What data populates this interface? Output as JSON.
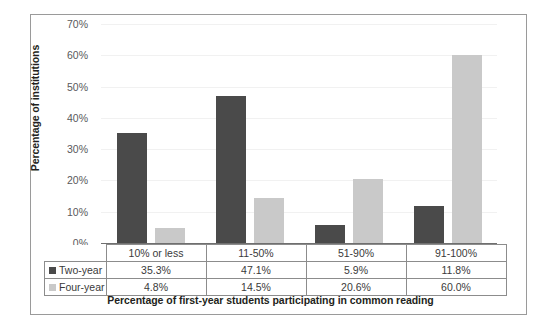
{
  "chart_data": {
    "type": "bar",
    "title": "",
    "xlabel": "Percentage of first-year students participating in common reading",
    "ylabel": "Percentage of institutions",
    "categories": [
      "10% or less",
      "11-50%",
      "51-90%",
      "91-100%"
    ],
    "series": [
      {
        "name": "Two-year",
        "color": "#4a4a4a",
        "values": [
          35.3,
          47.1,
          5.9,
          11.8
        ],
        "labels": [
          "35.3%",
          "47.1%",
          "5.9%",
          "11.8%"
        ]
      },
      {
        "name": "Four-year",
        "color": "#c9c9c9",
        "values": [
          4.8,
          14.5,
          20.6,
          60.0
        ],
        "labels": [
          "4.8%",
          "14.5%",
          "20.6%",
          "60.0%"
        ]
      }
    ],
    "ylim": [
      0,
      70
    ],
    "ytick_labels": [
      "70%",
      "60%",
      "50%",
      "40%",
      "30%",
      "20%",
      "10%",
      "0%"
    ],
    "ytick_values": [
      70,
      60,
      50,
      40,
      30,
      20,
      10,
      0
    ],
    "grid": true,
    "legend_position": "table-left"
  },
  "axes": {
    "y_title": "Percentage of institutions",
    "x_title": "Percentage of first-year students participating in common reading"
  },
  "table": {
    "legend_labels": [
      "Two-year",
      "Four-year"
    ],
    "header_cells": [
      "10% or less",
      "11-50%",
      "51-90%",
      "91-100%"
    ],
    "rows": [
      [
        "35.3%",
        "47.1%",
        "5.9%",
        "11.8%"
      ],
      [
        "4.8%",
        "14.5%",
        "20.6%",
        "60.0%"
      ]
    ]
  }
}
